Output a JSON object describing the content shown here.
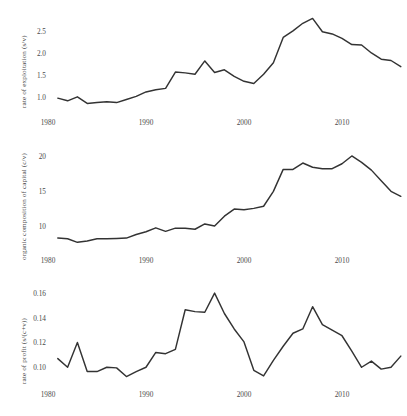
{
  "figure": {
    "background": "#ffffff",
    "line_color": "#333333",
    "text_color": "#4a4a4a"
  },
  "chart_data": [
    {
      "type": "line",
      "title": "",
      "xlabel": "",
      "ylabel": "rate of exploitation (s/v)",
      "xlim": [
        1980,
        2017
      ],
      "ylim": [
        0.78,
        2.88
      ],
      "xticks": [
        1980,
        1990,
        2000,
        2010
      ],
      "xticklabels": [
        "1980",
        "1990",
        "2000",
        "2010"
      ],
      "yticks": [
        1.0,
        1.5,
        2.0,
        2.5
      ],
      "yticklabels": [
        "1.0",
        "1.5",
        "2.0",
        "2.5"
      ],
      "grid": false,
      "legend": "none",
      "x": [
        1981,
        1982,
        1983,
        1984,
        1985,
        1986,
        1987,
        1988,
        1989,
        1990,
        1991,
        1992,
        1993,
        1994,
        1995,
        1996,
        1997,
        1998,
        1999,
        2000,
        2001,
        2002,
        2003,
        2004,
        2005,
        2006,
        2007,
        2008,
        2009,
        2010,
        2011,
        2012,
        2013,
        2014,
        2015,
        2016
      ],
      "values": [
        0.98,
        0.92,
        1.01,
        0.86,
        0.88,
        0.9,
        0.88,
        0.95,
        1.02,
        1.12,
        1.17,
        1.2,
        1.57,
        1.55,
        1.52,
        1.82,
        1.56,
        1.62,
        1.47,
        1.36,
        1.31,
        1.52,
        1.78,
        2.35,
        2.5,
        2.67,
        2.78,
        2.48,
        2.43,
        2.33,
        2.19,
        2.18,
        2.0,
        1.86,
        1.83,
        1.69
      ]
    },
    {
      "type": "line",
      "title": "",
      "xlabel": "",
      "ylabel": "organic composition of capital (c/v)",
      "xlim": [
        1980,
        2017
      ],
      "ylim": [
        7.0,
        20.7
      ],
      "xticks": [
        1980,
        1990,
        2000,
        2010
      ],
      "xticklabels": [
        "1980",
        "1990",
        "2000",
        "2010"
      ],
      "yticks": [
        10,
        15,
        20
      ],
      "yticklabels": [
        "10",
        "15",
        "20"
      ],
      "grid": false,
      "legend": "none",
      "x": [
        1981,
        1982,
        1983,
        1984,
        1985,
        1986,
        1987,
        1988,
        1989,
        1990,
        1991,
        1992,
        1993,
        1994,
        1995,
        1996,
        1997,
        1998,
        1999,
        2000,
        2001,
        2002,
        2003,
        2004,
        2005,
        2006,
        2007,
        2008,
        2009,
        2010,
        2011,
        2012,
        2013,
        2014,
        2015,
        2016
      ],
      "values": [
        8.4,
        8.3,
        7.8,
        8.0,
        8.3,
        8.3,
        8.35,
        8.4,
        8.9,
        9.3,
        9.85,
        9.35,
        9.8,
        9.8,
        9.65,
        10.4,
        10.1,
        11.5,
        12.5,
        12.4,
        12.6,
        12.9,
        15.0,
        18.1,
        18.1,
        19.0,
        18.4,
        18.2,
        18.2,
        18.9,
        20.0,
        19.1,
        18.0,
        16.5,
        15.0,
        14.3
      ]
    },
    {
      "type": "line",
      "title": "",
      "xlabel": "",
      "ylabel": "rate of profit (s/(c+v))",
      "xlim": [
        1980,
        2017
      ],
      "ylim": [
        0.0905,
        0.1625
      ],
      "xticks": [
        1980,
        1990,
        2000,
        2010
      ],
      "xticklabels": [
        "1980",
        "1990",
        "2000",
        "2010"
      ],
      "yticks": [
        0.1,
        0.12,
        0.14,
        0.16
      ],
      "yticklabels": [
        "0.10",
        "0.12",
        "0.14",
        "0.16"
      ],
      "grid": false,
      "legend": "none",
      "x": [
        1981,
        1982,
        1983,
        1984,
        1985,
        1986,
        1987,
        1988,
        1989,
        1990,
        1991,
        1992,
        1993,
        1994,
        1995,
        1996,
        1997,
        1998,
        1999,
        2000,
        2001,
        2002,
        2003,
        2004,
        2005,
        2006,
        2007,
        2008,
        2009,
        2010,
        2011,
        2012,
        2013,
        2014,
        2015,
        2016
      ],
      "values": [
        0.107,
        0.1,
        0.12,
        0.0965,
        0.0965,
        0.1,
        0.0995,
        0.0925,
        0.0965,
        0.1,
        0.112,
        0.111,
        0.1145,
        0.1465,
        0.145,
        0.1445,
        0.16,
        0.1435,
        0.131,
        0.1205,
        0.0975,
        0.093,
        0.1055,
        0.117,
        0.1275,
        0.131,
        0.149,
        0.1345,
        0.13,
        0.1255,
        0.113,
        0.1,
        0.105,
        0.0985,
        0.1,
        0.109
      ]
    }
  ]
}
